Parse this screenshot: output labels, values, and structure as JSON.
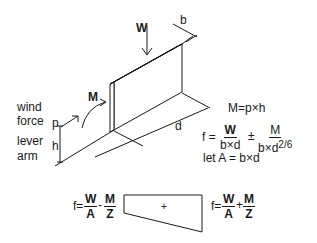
{
  "diagram": {
    "labels": {
      "W": "W",
      "b": "b",
      "M": "M",
      "d": "d",
      "p": "p",
      "h": "h",
      "wind_force": [
        "wind",
        "force"
      ],
      "lever_arm": [
        "lever",
        "arm"
      ]
    },
    "equations": {
      "moment": "M=p×h",
      "f_prefix": "f =",
      "f_term1": {
        "num": "W",
        "den": "b×d"
      },
      "pm": "±",
      "f_term2": {
        "num": "M",
        "den": "b×d",
        "den_exp": "2/6"
      },
      "let_A": "let A = b×d"
    },
    "stress_diagram": {
      "left": {
        "prefix": "f=",
        "t1": {
          "num": "W",
          "den": "A"
        },
        "op": "-",
        "t2": {
          "num": "M",
          "den": "Z"
        }
      },
      "center_sign": "+",
      "right": {
        "prefix": "f=",
        "t1": {
          "num": "W",
          "den": "A"
        },
        "op": "+",
        "t2": {
          "num": "M",
          "den": "Z"
        }
      }
    }
  }
}
